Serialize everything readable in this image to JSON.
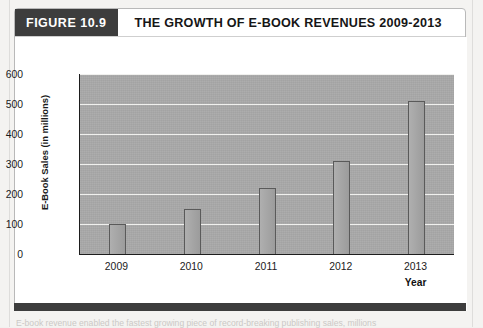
{
  "figure": {
    "badge_label": "FIGURE 10.9",
    "title": "THE GROWTH OF E-BOOK REVENUES 2009-2013",
    "caption": "E-book revenue enabled the fastest growing piece of record-breaking publishing sales, millions"
  },
  "colors": {
    "badge_bg": "#3d3d3d",
    "plot_bg": "#a9a9a9",
    "gridline": "#f0f0ee",
    "bar_fill": "#a4a4a4",
    "bar_stroke": "#5a5a5a",
    "axis": "#1d1d1d"
  },
  "chart_data": {
    "type": "bar",
    "title": "THE GROWTH OF E-BOOK REVENUES 2009-2013",
    "categories": [
      "2009",
      "2010",
      "2011",
      "2012",
      "2013"
    ],
    "values": [
      100,
      150,
      220,
      310,
      510
    ],
    "series": [
      {
        "name": "E-Book Sales",
        "values": [
          100,
          150,
          220,
          310,
          510
        ]
      }
    ],
    "xlabel": "Year",
    "ylabel": "E-Book Sales (in millions)",
    "ylim": [
      0,
      600
    ],
    "ytick_labels": [
      "0",
      "100",
      "200",
      "300",
      "400",
      "500",
      "600"
    ],
    "ytick_values": [
      0,
      100,
      200,
      300,
      400,
      500,
      600
    ],
    "grid": true,
    "legend": "none"
  }
}
